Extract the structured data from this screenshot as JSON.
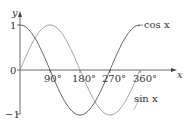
{
  "chart_data": {
    "type": "line",
    "title": "",
    "xlabel": "x",
    "ylabel": "y",
    "xlim": [
      0,
      360
    ],
    "ylim": [
      -1,
      1
    ],
    "x_ticks": [
      "90°",
      "180°",
      "270°",
      "360°"
    ],
    "y_ticks": [
      "1",
      "0",
      "−1"
    ],
    "grid": false,
    "series": [
      {
        "name": "cos x",
        "label": "cos x",
        "function": "cos",
        "color": "#555555",
        "x": [
          0,
          90,
          180,
          270,
          360
        ],
        "values": [
          1,
          0,
          -1,
          0,
          1
        ]
      },
      {
        "name": "sin x",
        "label": "sin x",
        "function": "sin",
        "color": "#9a9a9a",
        "x": [
          0,
          90,
          180,
          270,
          360
        ],
        "values": [
          0,
          1,
          0,
          -1,
          0
        ]
      }
    ],
    "legend": "inline labels at right"
  },
  "labels": {
    "x_axis": "x",
    "y_axis": "y",
    "tick_90": "90°",
    "tick_180": "180°",
    "tick_270": "270°",
    "tick_360": "360°",
    "y_one": "1",
    "y_zero": "0",
    "y_neg_one": "−1",
    "cos_label": "cos x",
    "sin_label": "sin x"
  }
}
